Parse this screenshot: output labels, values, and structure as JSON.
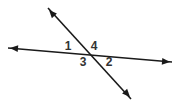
{
  "figure": {
    "background_color": "#ffffff",
    "line_color": "#1a1a1a",
    "label_color": "#333333",
    "line_width": 1.6,
    "width": 180,
    "height": 106,
    "intersection": {
      "x": 90,
      "y": 55
    },
    "lines": [
      {
        "name": "transversal-horizontal",
        "x1": 8,
        "y1": 48,
        "x2": 172,
        "y2": 62,
        "arrow_start": true,
        "arrow_end": true
      },
      {
        "name": "transversal-diagonal",
        "x1": 48,
        "y1": 8,
        "x2": 131,
        "y2": 99,
        "arrow_start": true,
        "arrow_end": true
      }
    ],
    "arrowheads": [
      {
        "name": "arrowhead-left",
        "x": 10,
        "y": 48,
        "angle": 185
      },
      {
        "name": "arrowhead-right",
        "x": 170,
        "y": 62,
        "angle": 5
      },
      {
        "name": "arrowhead-upper-left",
        "x": 49,
        "y": 10,
        "angle": 227.6
      },
      {
        "name": "arrowhead-lower-right",
        "x": 130,
        "y": 97,
        "angle": 47.6
      }
    ],
    "labels": [
      {
        "name": "angle-label-1",
        "text": "1",
        "x": 68,
        "y": 47
      },
      {
        "name": "angle-label-4",
        "text": "4",
        "x": 94,
        "y": 47
      },
      {
        "name": "angle-label-3",
        "text": "3",
        "x": 83,
        "y": 63
      },
      {
        "name": "angle-label-2",
        "text": "2",
        "x": 109,
        "y": 63
      }
    ]
  }
}
